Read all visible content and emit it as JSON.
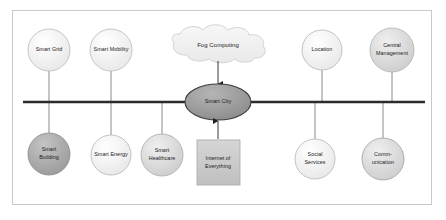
{
  "diagram": {
    "center_node": {
      "label": "Smart City",
      "shape": "ellipse",
      "fill": "#949494",
      "stroke": "#3c3c3c"
    },
    "cloud_node": {
      "label": "Fog Computing",
      "shape": "cloud",
      "fill": "#f0f0f0",
      "stroke": "#cfcfcf"
    },
    "box_node": {
      "label_line1": "Internet of",
      "label_line2": "Everything",
      "shape": "rectangle",
      "fill": "#c6c6c6",
      "stroke": "#aeaeae"
    },
    "backbone": {
      "color": "#2b2b2b",
      "y": 102
    },
    "top_nodes": [
      {
        "id": "smart-grid",
        "label_line1": "Smart Grid",
        "label_line2": "",
        "fill": "#fbfbfb",
        "stroke": "#c0c0c0",
        "cx": 49,
        "cy": 50,
        "r": 21
      },
      {
        "id": "smart-mobility",
        "label_line1": "Smart Mobility",
        "label_line2": "",
        "fill": "#f4f4f4",
        "stroke": "#c0c0c0",
        "cx": 111,
        "cy": 50,
        "r": 21
      },
      {
        "id": "location",
        "label_line1": "Location",
        "label_line2": "",
        "fill": "#eeeeee",
        "stroke": "#bdbdbd",
        "cx": 322,
        "cy": 50,
        "r": 20
      },
      {
        "id": "central-management",
        "label_line1": "Central",
        "label_line2": "Management",
        "fill": "#e4e4e4",
        "stroke": "#b6b6b6",
        "cx": 392,
        "cy": 50,
        "r": 22
      }
    ],
    "bottom_nodes": [
      {
        "id": "smart-building",
        "label_line1": "Smart",
        "label_line2": "Building",
        "fill": "#a9a9a9",
        "stroke": "#8f8f8f",
        "cx": 49,
        "cy": 154,
        "r": 21
      },
      {
        "id": "smart-energy",
        "label_line1": "Smart Energy",
        "label_line2": "",
        "fill": "#efefef",
        "stroke": "#bcbcbc",
        "cx": 111,
        "cy": 155,
        "r": 20
      },
      {
        "id": "smart-healthcare",
        "label_line1": "Smart",
        "label_line2": "Healthcare",
        "fill": "#d8d8d8",
        "stroke": "#b0b0b0",
        "cx": 162,
        "cy": 155,
        "r": 21
      },
      {
        "id": "social-services",
        "label_line1": "Social",
        "label_line2": "Services",
        "fill": "#f0f0f0",
        "stroke": "#bdbdbd",
        "cx": 315,
        "cy": 159,
        "r": 20
      },
      {
        "id": "communication",
        "label_line1": "Comm-",
        "label_line2": "unication",
        "fill": "#d2d2d2",
        "stroke": "#a8a8a8",
        "cx": 383,
        "cy": 159,
        "r": 21
      }
    ]
  }
}
